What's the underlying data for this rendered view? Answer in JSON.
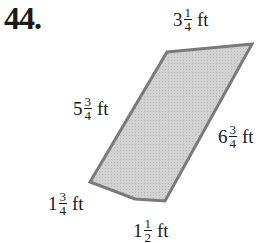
{
  "problem_number": "44.",
  "shape": {
    "type": "polygon",
    "fill": "#cfcfcf",
    "stroke": "#7a7a7a",
    "points": "167,52 252,44 165,201 135,199 90,182"
  },
  "labels": {
    "top": {
      "whole": "3",
      "num": "1",
      "den": "4",
      "unit": "ft"
    },
    "left": {
      "whole": "5",
      "num": "3",
      "den": "4",
      "unit": "ft"
    },
    "right": {
      "whole": "6",
      "num": "3",
      "den": "4",
      "unit": "ft"
    },
    "bottom_left": {
      "whole": "1",
      "num": "3",
      "den": "4",
      "unit": "ft"
    },
    "bottom": {
      "whole": "1",
      "num": "1",
      "den": "2",
      "unit": "ft"
    }
  }
}
